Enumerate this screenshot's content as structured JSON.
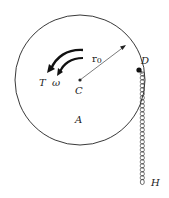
{
  "diagram": {
    "type": "mechanics-figure",
    "disk": {
      "label": "A",
      "center_label": "C",
      "radius_label": "r0"
    },
    "attachment_point": "D",
    "chain_end": "H",
    "torque_label": "T",
    "angular_velocity_label": "ω",
    "colors": {
      "stroke": "#222222",
      "background": "#ffffff"
    }
  }
}
